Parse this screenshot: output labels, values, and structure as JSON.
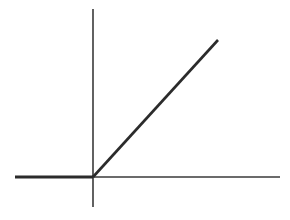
{
  "figure": {
    "name": "relu-activation-function-plot",
    "background_color": "#ffffff",
    "width": 290,
    "height": 220
  },
  "chart_data": {
    "type": "line",
    "title": "",
    "subtitle": "",
    "xlabel": "",
    "ylabel": "",
    "legend": [],
    "legend_position": "none",
    "grid": false,
    "axes": {
      "x_axis": {
        "label": "",
        "tick_labels": [],
        "shown": true,
        "color": "#3a3a3a",
        "pixel_y": 177,
        "pixel_x_start": 15,
        "pixel_x_end": 280,
        "stroke_width": 1.6
      },
      "y_axis": {
        "label": "",
        "tick_labels": [],
        "shown": true,
        "color": "#3a3a3a",
        "pixel_x": 93,
        "pixel_y_start": 9,
        "pixel_y_end": 207,
        "stroke_width": 1.6
      }
    },
    "xlim": [
      -3.1,
      6.0
    ],
    "ylim": [
      -0.7,
      3.7
    ],
    "series": [
      {
        "name": "relu",
        "color": "#2b2b2b",
        "stroke_width": 2.6,
        "x": [
          -2.7,
          0.0,
          2.75
        ],
        "values": [
          0.0,
          0.0,
          2.75
        ],
        "segments": [
          {
            "name": "flat-segment",
            "x1": -2.7,
            "y1": 0.0,
            "x2": 0.0,
            "y2": 0.0,
            "pixel_x1": 15,
            "pixel_y1": 177,
            "pixel_x2": 93,
            "pixel_y2": 177,
            "stroke_width": 3.0
          },
          {
            "name": "linear-segment",
            "x1": 0.0,
            "y1": 0.0,
            "x2": 2.75,
            "y2": 3.0,
            "pixel_x1": 93,
            "pixel_y1": 177,
            "pixel_x2": 218,
            "pixel_y2": 40,
            "stroke_width": 2.6
          }
        ]
      }
    ],
    "annotations": []
  }
}
